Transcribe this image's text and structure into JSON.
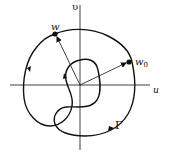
{
  "figure": {
    "axes": {
      "horizontal_label": "u",
      "vertical_label": "υ"
    },
    "points": {
      "w": {
        "label": "w"
      },
      "w0": {
        "label": "w",
        "subscript": "0"
      }
    },
    "curve": {
      "label": "Γ"
    },
    "colors": {
      "stroke": "#111111",
      "background": "#ffffff"
    }
  }
}
